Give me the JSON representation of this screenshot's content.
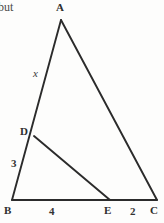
{
  "page": {
    "background_color": "#fdfdfc",
    "ink_color": "#2b2b2b",
    "text_fragment": "but"
  },
  "figure": {
    "kind": "geometry-diagram",
    "vertices": [
      {
        "name": "A",
        "label": "A",
        "x": 61,
        "y": 20
      },
      {
        "name": "B",
        "label": "B",
        "x": 12,
        "y": 200
      },
      {
        "name": "C",
        "label": "C",
        "x": 157,
        "y": 200
      },
      {
        "name": "D",
        "label": "D",
        "x": 34,
        "y": 136
      },
      {
        "name": "E",
        "label": "E",
        "x": 110,
        "y": 200
      }
    ],
    "segments": [
      {
        "name": "AB",
        "from": "A",
        "to": "B"
      },
      {
        "name": "AC",
        "from": "A",
        "to": "C"
      },
      {
        "name": "BC",
        "from": "B",
        "to": "C"
      },
      {
        "name": "DE",
        "from": "D",
        "to": "E"
      }
    ],
    "measure_labels": [
      {
        "name": "AD",
        "label": "x",
        "style": "italic"
      },
      {
        "name": "DB",
        "label": "3",
        "style": "bold"
      },
      {
        "name": "BE",
        "label": "4",
        "style": "bold"
      },
      {
        "name": "EC",
        "label": "2",
        "style": "bold"
      }
    ]
  }
}
